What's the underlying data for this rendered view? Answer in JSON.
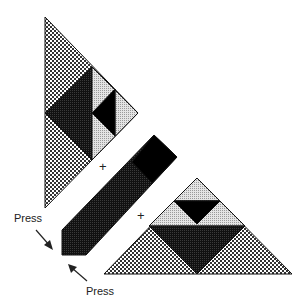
{
  "diagram": {
    "labels": {
      "press_left": "Press",
      "press_bottom": "Press",
      "plus_1": "+",
      "plus_2": "+"
    },
    "colors": {
      "background": "#ffffff",
      "dark": "#1a1a1a",
      "black": "#000000",
      "light_gray": "#cfcfcf",
      "check_dark": "#333333",
      "outline": "#111111"
    },
    "pieces": [
      {
        "name": "left-triangle",
        "fill": "checker",
        "points": [
          [
            45,
            17
          ],
          [
            138,
            113
          ],
          [
            45,
            208
          ]
        ]
      },
      {
        "name": "left-dark-triangle",
        "fill": "dark",
        "points": [
          [
            45,
            113
          ],
          [
            92,
            67
          ],
          [
            92,
            160
          ]
        ]
      },
      {
        "name": "left-light-region",
        "fill": "light",
        "points": [
          [
            92,
            67
          ],
          [
            138,
            113
          ],
          [
            92,
            160
          ]
        ]
      },
      {
        "name": "left-black-triangle",
        "fill": "black",
        "points": [
          [
            92,
            113
          ],
          [
            115,
            89
          ],
          [
            115,
            136
          ]
        ]
      },
      {
        "name": "bar",
        "fill": "dark",
        "points": [
          [
            154,
            135
          ],
          [
            177,
            157
          ],
          [
            86,
            255
          ],
          [
            62,
            255
          ],
          [
            62,
            230
          ]
        ]
      },
      {
        "name": "bar-black-end",
        "fill": "black",
        "points": [
          [
            154,
            135
          ],
          [
            177,
            157
          ],
          [
            152,
            183
          ],
          [
            132,
            162
          ]
        ]
      },
      {
        "name": "right-triangle",
        "fill": "checker",
        "points": [
          [
            197,
            178
          ],
          [
            292,
            274
          ],
          [
            104,
            274
          ]
        ]
      },
      {
        "name": "right-top-light",
        "fill": "light",
        "points": [
          [
            197,
            178
          ],
          [
            220,
            201
          ],
          [
            174,
            201
          ]
        ]
      },
      {
        "name": "right-mid-light",
        "fill": "light",
        "points": [
          [
            174,
            201
          ],
          [
            220,
            201
          ],
          [
            245,
            226
          ],
          [
            149,
            226
          ]
        ]
      },
      {
        "name": "right-mid-black",
        "fill": "black",
        "points": [
          [
            174,
            201
          ],
          [
            220,
            201
          ],
          [
            197,
            224
          ]
        ]
      },
      {
        "name": "right-big-dark",
        "fill": "dark",
        "points": [
          [
            149,
            226
          ],
          [
            245,
            226
          ],
          [
            197,
            274
          ]
        ]
      }
    ]
  }
}
